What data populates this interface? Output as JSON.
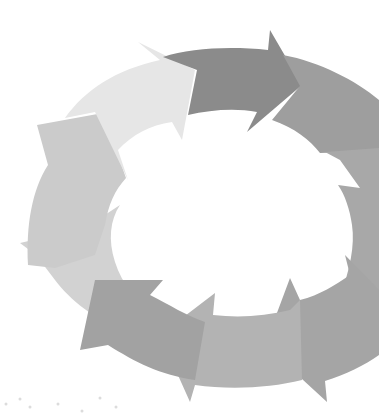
{
  "diagram": {
    "type": "cycle",
    "direction": "clockwise",
    "segment_count": 8,
    "labels": [],
    "colors": {
      "background": "#ffffff",
      "seg_top": "#8a8a8a",
      "seg_top_right": "#9c9c9c",
      "seg_right": "#a4a4a4",
      "seg_bottom_right": "#a6a6a6",
      "seg_bottom": "#b0b0b0",
      "seg_bottom_left": "#a0a0a0",
      "seg_left": "#cfcfcf",
      "seg_top_left": "#e6e6e6"
    }
  }
}
